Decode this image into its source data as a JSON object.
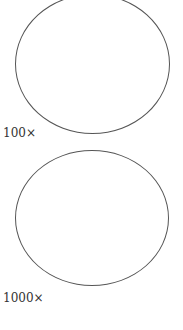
{
  "figures": [
    {
      "label": "100×"
    },
    {
      "label": "1000×"
    }
  ],
  "colors": {
    "stroke": "#555555",
    "text": "#333333",
    "background": "#ffffff"
  }
}
